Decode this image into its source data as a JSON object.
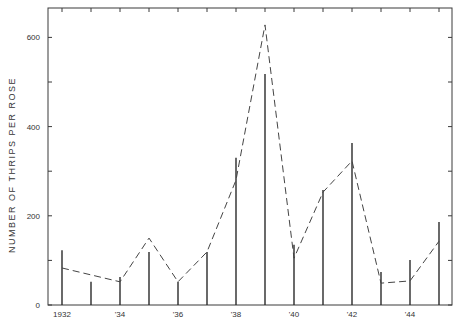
{
  "chart_data": {
    "type": "bar",
    "title": "",
    "xlabel": "",
    "ylabel": "NUMBER OF THRIPS PER ROSE",
    "ylim": [
      0,
      650
    ],
    "yticks": [
      0,
      200,
      400,
      600
    ],
    "minor_yticks": [
      100,
      300,
      500
    ],
    "xtick_labels": [
      {
        "year": 1932,
        "label": "1932"
      },
      {
        "year": 1934,
        "label": "'34"
      },
      {
        "year": 1936,
        "label": "'36"
      },
      {
        "year": 1938,
        "label": "'38"
      },
      {
        "year": 1940,
        "label": "'40"
      },
      {
        "year": 1942,
        "label": "'42"
      },
      {
        "year": 1944,
        "label": "'44"
      }
    ],
    "categories": [
      1932,
      1933,
      1934,
      1935,
      1936,
      1937,
      1938,
      1939,
      1940,
      1941,
      1942,
      1943,
      1944,
      1945
    ],
    "series": [
      {
        "name": "Bars (vertical lines)",
        "style": "solid-spike",
        "values": [
          123,
          52,
          63,
          119,
          52,
          119,
          330,
          518,
          135,
          258,
          363,
          74,
          101,
          186
        ]
      },
      {
        "name": "Dashed line",
        "style": "dashed",
        "values": [
          83,
          null,
          52,
          150,
          52,
          119,
          280,
          628,
          105,
          253,
          323,
          49,
          54,
          143
        ]
      }
    ],
    "grid": false,
    "legend": "none"
  }
}
